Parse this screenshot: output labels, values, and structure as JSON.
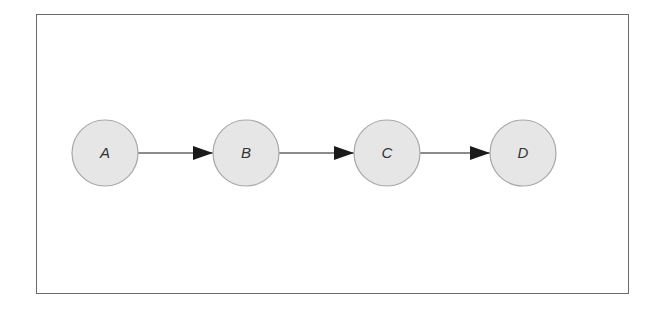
{
  "diagram": {
    "type": "linear-chain",
    "nodes": [
      {
        "id": "A",
        "label": "A",
        "cx": 105,
        "cy": 153
      },
      {
        "id": "B",
        "label": "B",
        "cx": 246,
        "cy": 153
      },
      {
        "id": "C",
        "label": "C",
        "cx": 387,
        "cy": 153
      },
      {
        "id": "D",
        "label": "D",
        "cx": 523,
        "cy": 153
      }
    ],
    "edges": [
      {
        "from": "A",
        "to": "B"
      },
      {
        "from": "B",
        "to": "C"
      },
      {
        "from": "C",
        "to": "D"
      }
    ],
    "colors": {
      "node_fill": "#e6e6e6",
      "node_stroke": "#a8a8a8",
      "edge": "#1a1a1a",
      "frame": "#6a6a6a"
    }
  }
}
